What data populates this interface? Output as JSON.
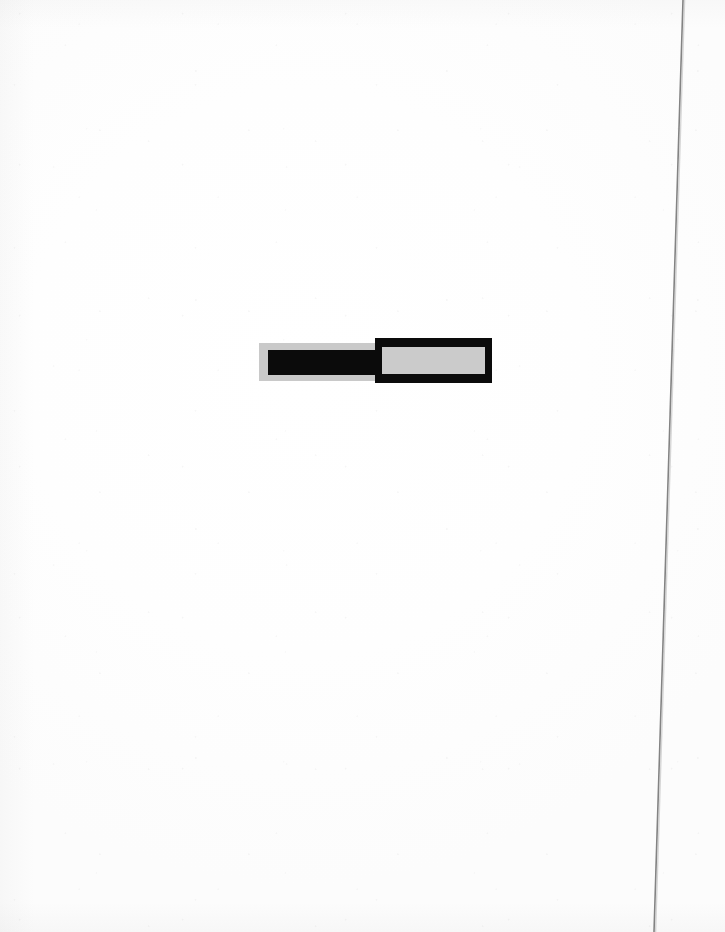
{
  "page": {
    "width": 725,
    "height": 932,
    "background_color": "#fdfdfd",
    "medium": "scanned paper",
    "title": ""
  },
  "sheet_edge": {
    "name": "page-edge-line",
    "color": "#6e6e6e",
    "top_x": 683,
    "bottom_x": 654,
    "thickness": 1.6,
    "description": "thin slightly slanted dark rule running full height near right margin"
  },
  "artwork": {
    "name": "bicolor-bar-composition",
    "x": 259,
    "y": 338,
    "width": 233,
    "height": 45,
    "colors": {
      "light": "#c9c9c9",
      "light_inner": "#cbcbcb",
      "dark": "#0b0b0b",
      "dark_inner": "#101010"
    },
    "panels": [
      {
        "id": "left",
        "name": "left-panel-light-field",
        "field_color": "#c9c9c9",
        "bar_color": "#0b0b0b",
        "x": 259,
        "y": 343,
        "width": 116,
        "height": 38,
        "inner_bar": {
          "name": "left-inner-dark-bar",
          "x": 268,
          "y": 350,
          "width": 107,
          "height": 25
        }
      },
      {
        "id": "right",
        "name": "right-panel-dark-field",
        "field_color": "#0b0b0b",
        "bar_color": "#cbcbcb",
        "x": 375,
        "y": 338,
        "width": 117,
        "height": 45,
        "inner_bar": {
          "name": "right-inner-light-bar",
          "x": 382,
          "y": 347,
          "width": 103,
          "height": 27
        }
      }
    ]
  }
}
